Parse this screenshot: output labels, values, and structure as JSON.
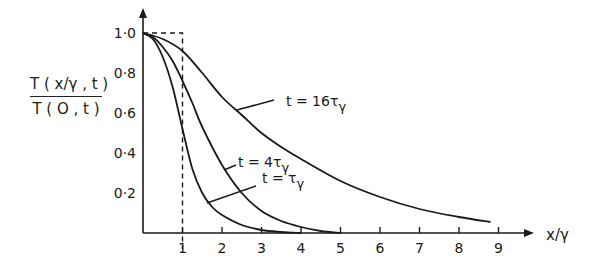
{
  "chart_data": {
    "type": "line",
    "title": "",
    "xlabel": "x/γ",
    "ylabel": "T(x/γ, t) / T(0, t)",
    "ylabel_numerator": "T ( x/γ , t )",
    "ylabel_denominator": "T ( O , t )",
    "xlim": [
      0,
      10
    ],
    "ylim": [
      0,
      1.0
    ],
    "grid": false,
    "legend": "inline annotations",
    "x_ticks": [
      1,
      2,
      3,
      4,
      5,
      6,
      7,
      8,
      9
    ],
    "x_tick_labels": [
      "1",
      "2",
      "3",
      "4",
      "5",
      "6",
      "7",
      "8",
      "9"
    ],
    "y_ticks": [
      0.2,
      0.4,
      0.6,
      0.8,
      1.0
    ],
    "y_tick_labels": [
      "0·2",
      "0·4",
      "0·6",
      "0·8",
      "1·0"
    ],
    "reference_line": {
      "style": "dashed",
      "description": "step at x/γ = 1",
      "points": [
        [
          0,
          1.0
        ],
        [
          1,
          1.0
        ],
        [
          1,
          -0.08
        ]
      ]
    },
    "series": [
      {
        "name": "t = τγ",
        "label": "t = τ",
        "label_sub": "γ",
        "x": [
          0,
          0.25,
          0.5,
          0.75,
          1.0,
          1.25,
          1.5,
          1.75,
          2.0,
          2.5,
          3.0,
          3.5,
          4.0
        ],
        "y": [
          1.0,
          0.97,
          0.88,
          0.73,
          0.52,
          0.32,
          0.2,
          0.13,
          0.09,
          0.04,
          0.015,
          0.005,
          0.0
        ]
      },
      {
        "name": "t = 4τγ",
        "label": "t = 4τ",
        "label_sub": "γ",
        "x": [
          0,
          0.25,
          0.5,
          0.75,
          1.0,
          1.25,
          1.5,
          2.0,
          2.5,
          3.0,
          3.5,
          4.0,
          4.5,
          5.0
        ],
        "y": [
          1.0,
          0.98,
          0.93,
          0.86,
          0.76,
          0.65,
          0.53,
          0.34,
          0.2,
          0.11,
          0.06,
          0.03,
          0.01,
          0.0
        ]
      },
      {
        "name": "t = 16τγ",
        "label": "t = 16τ",
        "label_sub": "γ",
        "x": [
          0,
          0.5,
          1.0,
          1.5,
          2.0,
          2.5,
          3.0,
          3.5,
          4.0,
          5.0,
          6.0,
          7.0,
          8.0,
          8.8
        ],
        "y": [
          1.0,
          0.97,
          0.91,
          0.8,
          0.68,
          0.59,
          0.5,
          0.43,
          0.37,
          0.26,
          0.18,
          0.12,
          0.08,
          0.055
        ]
      }
    ]
  },
  "annotations": [
    {
      "text": "t = 16τ",
      "sub": "γ",
      "x": 286,
      "y": 106,
      "leader": [
        [
          237,
          110
        ],
        [
          274,
          100
        ]
      ]
    },
    {
      "text": "t = 4τ",
      "sub": "γ",
      "x": 238,
      "y": 167,
      "leader": [
        [
          224,
          170
        ],
        [
          236,
          165
        ]
      ]
    },
    {
      "text": "t = τ",
      "sub": "γ",
      "x": 262,
      "y": 183,
      "leader": [
        [
          207,
          203
        ],
        [
          256,
          186
        ]
      ]
    }
  ],
  "colors": {
    "ink": "#1a1a1a",
    "background": "#ffffff"
  }
}
